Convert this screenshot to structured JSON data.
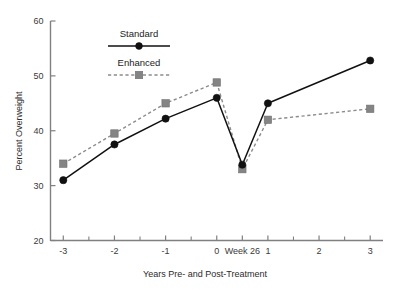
{
  "chart_data": {
    "type": "line",
    "title": "",
    "xlabel": "Years Pre- and Post-Treatment",
    "ylabel": "Percent Overweight",
    "x_tick_labels": [
      "-3",
      "-2",
      "-1",
      "0",
      "Week 26",
      "1",
      "2",
      "3"
    ],
    "x_tick_values": [
      -3,
      -2,
      -1,
      0,
      0.5,
      1,
      2,
      3
    ],
    "x_minor_tick_values": [
      -2.5,
      -1.5,
      -0.5,
      1.5,
      2.5
    ],
    "xlim": [
      -3.25,
      3.25
    ],
    "y_tick_labels": [
      "20",
      "30",
      "40",
      "50",
      "60"
    ],
    "y_tick_values": [
      20,
      30,
      40,
      50,
      60
    ],
    "ylim": [
      20,
      60
    ],
    "grid": false,
    "legend_position": "upper-left-inside",
    "series": [
      {
        "name": "Standard",
        "color": "#111111",
        "line_style": "solid",
        "marker": "circle",
        "x": [
          -3,
          -2,
          -1,
          0,
          0.5,
          1,
          3
        ],
        "values": [
          31.0,
          37.5,
          42.2,
          46.0,
          33.8,
          45.0,
          52.8
        ]
      },
      {
        "name": "Enhanced",
        "color": "#848484",
        "line_style": "dashed",
        "marker": "square",
        "x": [
          -3,
          -2,
          -1,
          0,
          0.5,
          1,
          3
        ],
        "values": [
          34.0,
          39.5,
          45.0,
          48.8,
          33.0,
          42.0,
          44.0
        ]
      }
    ]
  },
  "legend": {
    "entries": [
      {
        "label": "Standard"
      },
      {
        "label": "Enhanced"
      }
    ]
  },
  "axes": {
    "y_axis_title": "Percent Overweight",
    "x_axis_title": "Years Pre- and Post-Treatment"
  }
}
